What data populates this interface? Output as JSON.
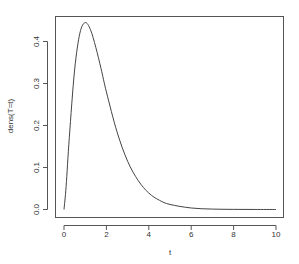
{
  "chart_data": {
    "type": "line",
    "title": "",
    "xlabel": "t",
    "ylabel": "dens(T=t)",
    "xlim": [
      0,
      10
    ],
    "ylim": [
      0,
      0.45
    ],
    "grid": false,
    "legend": null,
    "x_ticks": [
      0,
      2,
      4,
      6,
      8,
      10
    ],
    "x_tick_labels": [
      "0",
      "2",
      "4",
      "6",
      "8",
      "10"
    ],
    "y_ticks": [
      0.0,
      0.1,
      0.2,
      0.3,
      0.4
    ],
    "y_tick_labels": [
      "0.0",
      "0.1",
      "0.2",
      "0.3",
      "0.4"
    ],
    "series": [
      {
        "name": "dens(T=t)",
        "color": "#444444",
        "x": [
          0,
          0.1,
          0.25,
          0.5,
          0.75,
          1.0,
          1.25,
          1.5,
          1.75,
          2.0,
          2.5,
          3.0,
          3.5,
          4.0,
          4.5,
          5.0,
          6.0,
          7.0,
          8.0,
          9.0,
          10.0
        ],
        "values": [
          0.0,
          0.055,
          0.171,
          0.332,
          0.42,
          0.445,
          0.428,
          0.386,
          0.335,
          0.28,
          0.185,
          0.115,
          0.069,
          0.039,
          0.022,
          0.012,
          0.0036,
          0.001,
          0.0003,
          0.0001,
          0.0
        ]
      }
    ]
  }
}
